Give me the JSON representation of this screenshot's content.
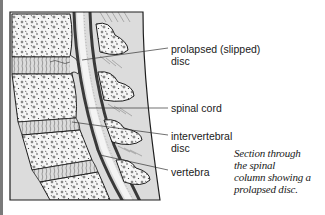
{
  "figure": {
    "title": "Section through the spinal column showing a prolapsed disc",
    "colors": {
      "background": "#ffffff",
      "tissue": "#dcdcdc",
      "bone": "#f6f6f6",
      "outline": "#1e1e1e",
      "cord_dark": "#4a4a4a",
      "edge_bar": "#7a7a7a"
    }
  },
  "labels": [
    {
      "id": "prolapsed-disc",
      "line1": "prolapsed (slipped)",
      "line2": "disc"
    },
    {
      "id": "spinal-cord",
      "line1": "spinal cord"
    },
    {
      "id": "intervertebral-disc",
      "line1": "intervertebral",
      "line2": "disc"
    },
    {
      "id": "vertebra",
      "line1": "vertebra"
    }
  ],
  "caption": {
    "lines": [
      "Section through",
      "the spinal",
      "column showing a",
      "prolapsed disc."
    ]
  }
}
